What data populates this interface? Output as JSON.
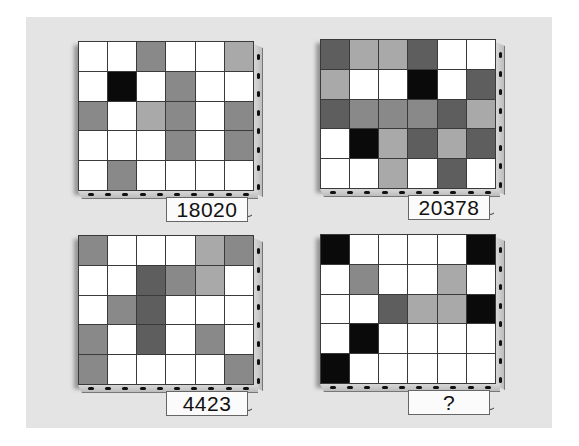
{
  "legend": {
    "W": "#ffffff",
    "L": "#a9a9a9",
    "M": "#898989",
    "D": "#5e5e5e",
    "B": "#0a0a0a"
  },
  "puzzles": [
    {
      "label": "18020",
      "grid": [
        [
          "W",
          "W",
          "M",
          "W",
          "W",
          "L"
        ],
        [
          "W",
          "B",
          "W",
          "M",
          "W",
          "W"
        ],
        [
          "M",
          "W",
          "L",
          "M",
          "W",
          "M"
        ],
        [
          "W",
          "W",
          "W",
          "M",
          "W",
          "M"
        ],
        [
          "W",
          "M",
          "W",
          "W",
          "W",
          "W"
        ]
      ]
    },
    {
      "label": "20378",
      "grid": [
        [
          "D",
          "L",
          "L",
          "D",
          "W",
          "W"
        ],
        [
          "L",
          "W",
          "W",
          "B",
          "W",
          "D"
        ],
        [
          "D",
          "M",
          "M",
          "M",
          "D",
          "L"
        ],
        [
          "W",
          "B",
          "L",
          "D",
          "L",
          "D"
        ],
        [
          "W",
          "W",
          "L",
          "W",
          "D",
          "W"
        ]
      ]
    },
    {
      "label": "4423",
      "grid": [
        [
          "M",
          "W",
          "W",
          "W",
          "L",
          "M"
        ],
        [
          "W",
          "W",
          "D",
          "M",
          "L",
          "W"
        ],
        [
          "W",
          "M",
          "D",
          "W",
          "W",
          "W"
        ],
        [
          "M",
          "W",
          "D",
          "W",
          "M",
          "W"
        ],
        [
          "M",
          "W",
          "W",
          "W",
          "W",
          "M"
        ]
      ]
    },
    {
      "label": "?",
      "grid": [
        [
          "B",
          "W",
          "W",
          "W",
          "W",
          "B"
        ],
        [
          "W",
          "M",
          "W",
          "W",
          "L",
          "W"
        ],
        [
          "W",
          "W",
          "D",
          "L",
          "L",
          "B"
        ],
        [
          "W",
          "B",
          "W",
          "W",
          "W",
          "W"
        ],
        [
          "B",
          "W",
          "W",
          "W",
          "W",
          "W"
        ]
      ]
    }
  ]
}
